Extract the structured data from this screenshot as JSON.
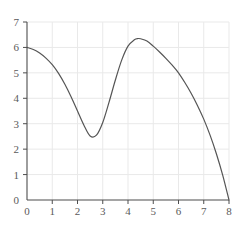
{
  "chart_data": {
    "type": "line",
    "title": "",
    "subtitle": "",
    "xlabel": "",
    "ylabel": "",
    "xlim": [
      0,
      8
    ],
    "ylim": [
      0,
      7
    ],
    "xticks": [
      0,
      1,
      2,
      3,
      4,
      5,
      6,
      7,
      8
    ],
    "yticks": [
      0,
      1,
      2,
      3,
      4,
      5,
      6,
      7
    ],
    "xtick_labels": [
      "0",
      "1",
      "2",
      "3",
      "4",
      "5",
      "6",
      "7",
      "8"
    ],
    "ytick_labels": [
      "0",
      "1",
      "2",
      "3",
      "4",
      "5",
      "6",
      "7"
    ],
    "grid": true,
    "legend": null,
    "legend_position": "none",
    "annotations": [],
    "series": [
      {
        "name": "curve",
        "color": "#555555",
        "line_width": 1.2,
        "x": [
          0.0,
          0.25,
          0.5,
          0.75,
          1.0,
          1.25,
          1.5,
          1.75,
          2.0,
          2.25,
          2.5,
          2.75,
          3.0,
          3.25,
          3.5,
          3.75,
          4.0,
          4.25,
          4.4,
          4.5,
          4.75,
          5.0,
          5.25,
          5.5,
          5.75,
          6.0,
          6.25,
          6.5,
          6.75,
          7.0,
          7.25,
          7.5,
          7.75,
          8.0
        ],
        "y": [
          6.0,
          5.92,
          5.78,
          5.58,
          5.32,
          4.98,
          4.55,
          4.05,
          3.5,
          2.95,
          2.52,
          2.55,
          3.05,
          3.85,
          4.72,
          5.5,
          6.05,
          6.3,
          6.35,
          6.34,
          6.25,
          6.05,
          5.82,
          5.57,
          5.3,
          5.0,
          4.62,
          4.2,
          3.72,
          3.18,
          2.55,
          1.82,
          0.98,
          0.0
        ]
      }
    ],
    "key_points": {
      "start": [
        0,
        6
      ],
      "local_minimum": [
        2.5,
        2.5
      ],
      "local_maximum": [
        4.4,
        6.35
      ],
      "end": [
        8,
        0
      ]
    },
    "colors": {
      "background": "#ffffff",
      "grid": "#e9e9e9",
      "axis": "#4d4d4d",
      "curve": "#555555",
      "tick_text": "#5a5a5a"
    }
  }
}
